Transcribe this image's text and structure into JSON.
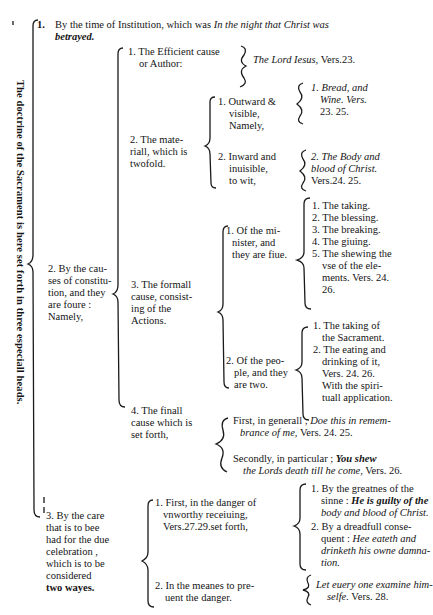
{
  "side_title": "The doctrine of the Sacrament is here set forth in three especiall heads.",
  "head1": {
    "num": "1.",
    "text": "By the time of Institution, which was",
    "italic": "In the night that Christ was",
    "italic2": "betrayed."
  },
  "head2": {
    "lines": [
      "2. By the cau-",
      "ses of constitu-",
      "tion, and they",
      "are foure :",
      "Namely,"
    ],
    "efficient": {
      "lines": [
        "1. The Efficient cause",
        "or Author:"
      ],
      "answer": "The Lord Iesus,",
      "ref": "Vers.23."
    },
    "material": {
      "lines": [
        "2. The mate-",
        "riall, which is",
        "twofold."
      ],
      "outward": {
        "lines": [
          "1. Outward &",
          "visible,",
          "Namely,"
        ],
        "answer": [
          "1. Bread, and",
          "Wine. Vers.",
          "23. 25."
        ]
      },
      "inward": {
        "lines": [
          "2. Inward and",
          "inuisible,",
          "to wit,"
        ],
        "answer": [
          "2. The Body and",
          "blood of Christ.",
          "Vers.24. 25."
        ]
      }
    },
    "formal": {
      "lines": [
        "3. The formall",
        "cause, consist-",
        "ing of the",
        "Actions."
      ],
      "minister": {
        "lines": [
          "1. Of the mi-",
          "nister, and",
          "they are fiue."
        ],
        "items": [
          "1. The taking.",
          "2. The blessing.",
          "3. The breaking.",
          "4. The giuing.",
          "5. The shewing the",
          "vse of the ele-",
          "ments. Vers. 24.",
          "26."
        ]
      },
      "people": {
        "lines": [
          "2. Of the peo-",
          "ple, and they",
          "are two."
        ],
        "items": [
          "1. The taking of",
          "the Sacrament.",
          "2. The eating and",
          "drinking of it,",
          "Vers. 24. 26.",
          "With the spiri-",
          "tuall application."
        ]
      }
    },
    "final": {
      "lines": [
        "4. The finall",
        "cause which is",
        "set forth,"
      ],
      "general": {
        "text": "First, in generall ;",
        "italic": "Doe this in remem-",
        "italic2": "brance of me,",
        "ref": "Vers. 24. 25."
      },
      "particular": {
        "text": "Secondly, in particular ;",
        "italic": "You shew",
        "italic2": "the Lords death till he come,",
        "ref": "Vers. 26."
      }
    }
  },
  "head3": {
    "lines": [
      "3. By the care",
      "that is to bee",
      "had for the due",
      "celebration ,",
      "which is to be",
      "considered",
      "two wayes."
    ],
    "danger": {
      "lines": [
        "1. First, in the danger of",
        "vnworthy receiuing,",
        "Vers.27.29.set forth,"
      ],
      "greatnes": [
        "1. By the greatnes of the",
        "sinne :"
      ],
      "greatnes_italic": [
        "He is guilty of the",
        "body and blood of Christ."
      ],
      "consequent": [
        "2. By a dreadfull conse-",
        "quent :"
      ],
      "consequent_italic": [
        "Hee eateth and",
        "drinketh his owne damna-",
        "tion."
      ]
    },
    "prevent": {
      "lines": [
        "2. In the meanes to pre-",
        "uent the danger."
      ],
      "italic": [
        "Let euery one examine him-",
        "selfe."
      ],
      "ref": "Vers. 28."
    }
  }
}
